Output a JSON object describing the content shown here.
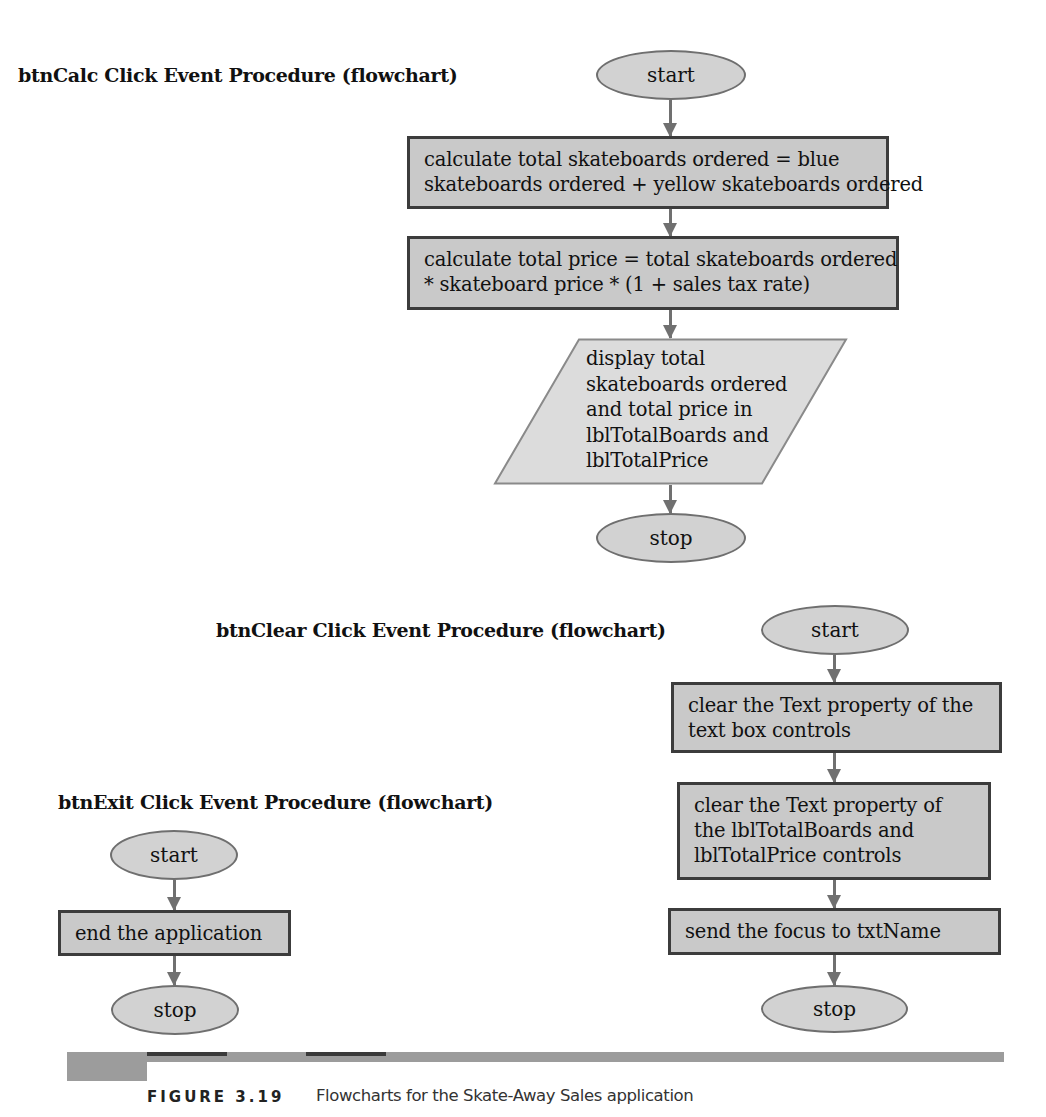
{
  "figure": {
    "label": "FIGURE 3.19",
    "caption": "Flowcharts for the Skate-Away Sales application"
  },
  "flowcharts": {
    "calc": {
      "title": "btnCalc Click Event Procedure (flowchart)",
      "start": "start",
      "steps": [
        {
          "type": "process",
          "lines": [
            "calculate total skateboards ordered = blue",
            "skateboards ordered + yellow skateboards ordered"
          ]
        },
        {
          "type": "process",
          "lines": [
            "calculate total price = total skateboards ordered",
            "* skateboard price * (1 + sales tax rate)"
          ]
        },
        {
          "type": "input-output",
          "lines": [
            "display total",
            "skateboards ordered",
            "and total price in",
            "lblTotalBoards and",
            "lblTotalPrice"
          ]
        }
      ],
      "stop": "stop"
    },
    "clear": {
      "title": "btnClear Click Event Procedure (flowchart)",
      "start": "start",
      "steps": [
        {
          "type": "process",
          "lines": [
            "clear the Text property of the",
            "text box controls"
          ]
        },
        {
          "type": "process",
          "lines": [
            "clear the Text property of",
            "the lblTotalBoards and",
            "lblTotalPrice controls"
          ]
        },
        {
          "type": "process",
          "lines": [
            "send the focus to txtName"
          ]
        }
      ],
      "stop": "stop"
    },
    "exit": {
      "title": "btnExit Click Event Procedure (flowchart)",
      "start": "start",
      "steps": [
        {
          "type": "process",
          "lines": [
            "end the application"
          ]
        }
      ],
      "stop": "stop"
    }
  },
  "colors": {
    "terminal_fill": "#d2d2d2",
    "process_fill": "#c9c9c9",
    "io_fill": "#dcdcdc",
    "border": "#3c3c3c",
    "arrow": "#707070"
  }
}
